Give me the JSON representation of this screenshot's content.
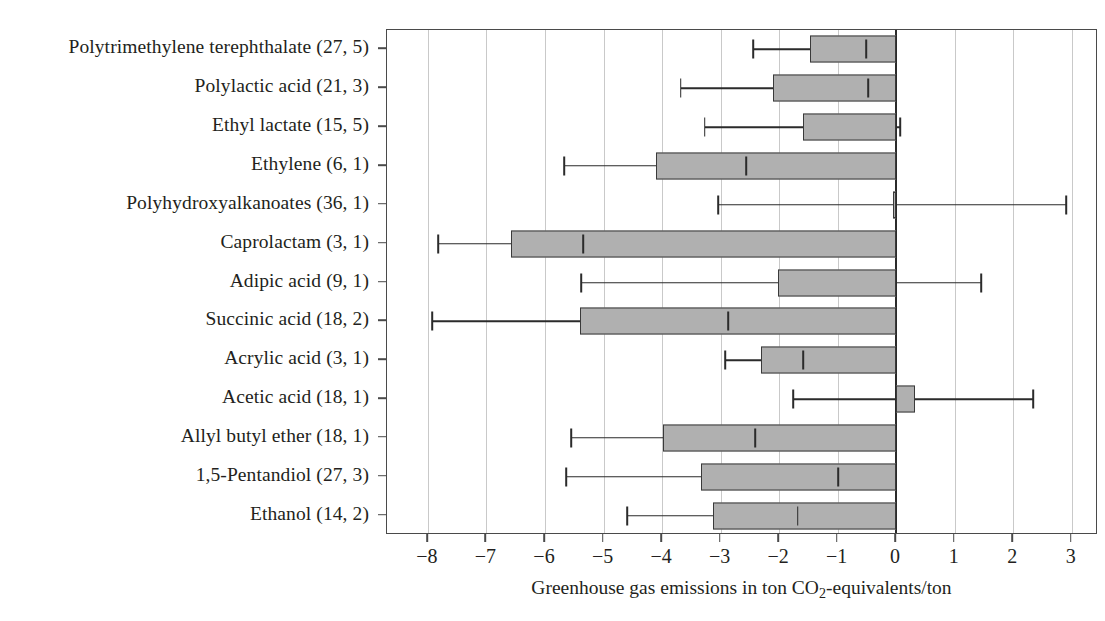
{
  "chart_data": {
    "type": "bar",
    "orientation": "horizontal",
    "title": "",
    "xlabel": "Greenhouse gas emissions in ton CO2-equivalents/ton",
    "xlabel_parts": {
      "pre": "Greenhouse gas emissions in ton CO",
      "sub": "2",
      "post": "-equivalents/ton"
    },
    "ylabel": "",
    "xlim": [
      -8.7,
      3.45
    ],
    "xticks": [
      -8,
      -7,
      -6,
      -5,
      -4,
      -3,
      -2,
      -1,
      0,
      1,
      2,
      3
    ],
    "xticklabels": [
      "−8",
      "−7",
      "−6",
      "−5",
      "−4",
      "−3",
      "−2",
      "−1",
      "0",
      "1",
      "2",
      "3"
    ],
    "grid": "vertical",
    "legend": "none",
    "bar_fill": "#b0b0b0",
    "bar_edge": "#3a3a3a",
    "error_bars": true,
    "categories": [
      "Polytrimethylene terephthalate (27, 5)",
      "Polylactic acid (21, 3)",
      "Ethyl lactate (15, 5)",
      "Ethylene (6, 1)",
      "Polyhydroxyalkanoates (36, 1)",
      "Caprolactam (3, 1)",
      "Adipic acid (9, 1)",
      "Succinic acid (18, 2)",
      "Acrylic acid (3, 1)",
      "Acetic acid (18, 1)",
      "Allyl butyl ether (18, 1)",
      "1,5-Pentandiol (27, 3)",
      "Ethanol (14, 2)"
    ],
    "values": [
      -1.47,
      -2.1,
      -1.59,
      -4.1,
      -0.05,
      -6.58,
      -2.02,
      -5.4,
      -2.31,
      0.33,
      -3.98,
      -3.33,
      -3.13
    ],
    "err_low": [
      -2.44,
      -3.68,
      -3.27,
      -5.67,
      -3.04,
      -7.83,
      -5.38,
      -7.93,
      -2.92,
      -1.76,
      -5.55,
      -5.64,
      -4.6
    ],
    "err_high": [
      -0.51,
      -0.48,
      0.07,
      -2.56,
      2.91,
      -5.35,
      1.45,
      -2.87,
      -1.59,
      2.34,
      -2.41,
      -0.99,
      -1.68
    ]
  }
}
